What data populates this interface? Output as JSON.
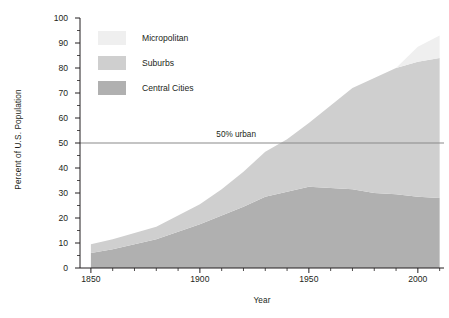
{
  "chart_data": {
    "type": "area",
    "stacked": true,
    "title": "",
    "xlabel": "Year",
    "ylabel": "Percent of U.S. Population",
    "xlim": [
      1845,
      2012
    ],
    "ylim": [
      0,
      100
    ],
    "xticks": [
      1850,
      1900,
      1950,
      2000
    ],
    "xtick_labels": [
      "1850",
      "1900",
      "1950",
      "2000"
    ],
    "xminor_step": 10,
    "yticks": [
      0,
      10,
      20,
      30,
      40,
      50,
      60,
      70,
      80,
      90,
      100
    ],
    "ytick_labels": [
      "0",
      "10",
      "20",
      "30",
      "40",
      "50",
      "60",
      "70",
      "80",
      "90",
      "100"
    ],
    "yminor_step": 5,
    "grid": false,
    "legend_position": "upper-left-inside",
    "x": [
      1850,
      1860,
      1870,
      1880,
      1890,
      1900,
      1910,
      1920,
      1930,
      1940,
      1950,
      1960,
      1970,
      1980,
      1990,
      2000,
      2010
    ],
    "series": [
      {
        "name": "Central Cities",
        "color": "#b0b0b0",
        "values": [
          6.0,
          7.5,
          9.5,
          11.5,
          14.5,
          17.5,
          21.0,
          24.5,
          28.5,
          30.5,
          32.5,
          32.0,
          31.5,
          30.0,
          29.5,
          28.5,
          28.0
        ]
      },
      {
        "name": "Suburbs",
        "color": "#cfcfcf",
        "values": [
          3.5,
          4.0,
          4.5,
          5.0,
          6.5,
          8.0,
          10.5,
          14.0,
          18.0,
          21.0,
          25.5,
          33.0,
          40.5,
          46.0,
          50.5,
          54.0,
          56.0
        ]
      },
      {
        "name": "Micropolitan",
        "color": "#efefef",
        "values": [
          0,
          0,
          0,
          0,
          0,
          0,
          0,
          0,
          0,
          0,
          0,
          0,
          0,
          0,
          0,
          6.0,
          9.0
        ]
      }
    ],
    "annotations": [
      {
        "name": "urban-threshold",
        "label": "50% urban",
        "y": 50,
        "type": "hline",
        "color": "#8a8a8a",
        "label_x": 1925
      }
    ],
    "totals_note": "Bands are stacked: Central Cities + Suburbs + Micropolitan"
  },
  "axes": {
    "y_title": "Percent of U.S. Population",
    "x_title": "Year"
  },
  "legend": {
    "items": [
      {
        "label": "Micropolitan",
        "color": "#efefef"
      },
      {
        "label": "Suburbs",
        "color": "#cfcfcf"
      },
      {
        "label": "Central Cities",
        "color": "#b0b0b0"
      }
    ]
  },
  "annotation": {
    "urban_label": "50% urban"
  },
  "colors": {
    "axis": "#231f20",
    "micropolitan": "#efefef",
    "suburbs": "#cfcfcf",
    "central_cities": "#b0b0b0",
    "threshold_line": "#8a8a8a",
    "background": "#ffffff"
  }
}
